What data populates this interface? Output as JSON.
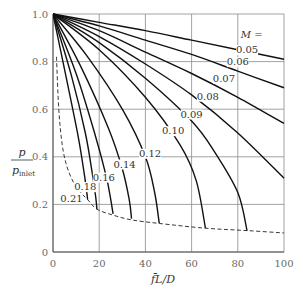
{
  "chart_data": {
    "type": "line",
    "title": "",
    "xlabel": "f̄L/D",
    "ylabel_num": "p",
    "ylabel_den": "p",
    "ylabel_den_sub": "inlet",
    "xlim": [
      0,
      100
    ],
    "ylim": [
      0,
      1.0
    ],
    "x_ticks": [
      "0",
      "20",
      "40",
      "60",
      "80",
      "100"
    ],
    "x_tick_values": [
      0,
      20,
      40,
      60,
      80,
      100
    ],
    "y_ticks": [
      "0",
      "0.2",
      "0.4",
      "0.6",
      "0.8",
      "1.0"
    ],
    "y_tick_values": [
      0,
      0.2,
      0.4,
      0.6,
      0.8,
      1.0
    ],
    "grid": true,
    "legend_header": "M =",
    "series": [
      {
        "name": "0.05",
        "label": "0.05",
        "x": [
          0,
          20,
          40,
          60,
          80,
          100
        ],
        "y": [
          1.0,
          0.965,
          0.93,
          0.89,
          0.85,
          0.81
        ]
      },
      {
        "name": "0.06",
        "label": "0.06",
        "x": [
          0,
          20,
          40,
          60,
          80,
          100
        ],
        "y": [
          1.0,
          0.95,
          0.89,
          0.83,
          0.76,
          0.69
        ]
      },
      {
        "name": "0.07",
        "label": "0.07",
        "x": [
          0,
          20,
          40,
          60,
          80,
          100
        ],
        "y": [
          1.0,
          0.93,
          0.84,
          0.75,
          0.65,
          0.54
        ]
      },
      {
        "name": "0.08",
        "label": "0.08",
        "x": [
          0,
          20,
          40,
          60,
          80,
          100
        ],
        "y": [
          1.0,
          0.905,
          0.79,
          0.66,
          0.5,
          0.31
        ]
      },
      {
        "name": "0.09",
        "label": "0.09",
        "x": [
          0,
          20,
          40,
          60,
          70,
          80,
          84
        ],
        "y": [
          1.0,
          0.88,
          0.73,
          0.55,
          0.42,
          0.25,
          0.09
        ]
      },
      {
        "name": "0.10",
        "label": "0.10",
        "x": [
          0,
          20,
          40,
          55,
          62,
          66
        ],
        "y": [
          1.0,
          0.85,
          0.65,
          0.45,
          0.3,
          0.1
        ]
      },
      {
        "name": "0.12",
        "label": "0.12",
        "x": [
          0,
          15,
          30,
          40,
          44,
          46
        ],
        "y": [
          1.0,
          0.82,
          0.6,
          0.4,
          0.25,
          0.12
        ]
      },
      {
        "name": "0.14",
        "label": "0.14",
        "x": [
          0,
          12,
          24,
          30,
          33,
          34
        ],
        "y": [
          1.0,
          0.78,
          0.52,
          0.35,
          0.22,
          0.14
        ]
      },
      {
        "name": "0.16",
        "label": "0.16",
        "x": [
          0,
          10,
          18,
          23,
          25,
          26
        ],
        "y": [
          1.0,
          0.75,
          0.5,
          0.32,
          0.22,
          0.16
        ]
      },
      {
        "name": "0.18",
        "label": "0.18",
        "x": [
          0,
          8,
          14,
          17,
          18.5,
          19
        ],
        "y": [
          1.0,
          0.74,
          0.5,
          0.33,
          0.23,
          0.18
        ]
      },
      {
        "name": "0.21",
        "label": "0.21",
        "x": [
          0,
          6,
          11,
          13.5,
          14.5,
          15
        ],
        "y": [
          1.0,
          0.72,
          0.48,
          0.33,
          0.26,
          0.22
        ]
      }
    ],
    "choked_line": {
      "name": "choking limit (dashed)",
      "x": [
        1.5,
        2.5,
        4,
        6,
        9,
        12,
        15,
        19,
        26,
        34,
        46,
        66,
        84,
        100
      ],
      "y": [
        0.82,
        0.6,
        0.45,
        0.36,
        0.29,
        0.25,
        0.22,
        0.18,
        0.155,
        0.135,
        0.12,
        0.1,
        0.09,
        0.08
      ]
    },
    "annotations": [
      {
        "text": "M =",
        "x": 86,
        "y": 0.9
      },
      {
        "text": "0.05",
        "x": 84,
        "y": 0.835
      },
      {
        "text": "0.06",
        "x": 80,
        "y": 0.785
      },
      {
        "text": "0.07",
        "x": 74,
        "y": 0.715
      },
      {
        "text": "0.08",
        "x": 67,
        "y": 0.64
      },
      {
        "text": "0.09",
        "x": 60,
        "y": 0.565
      },
      {
        "text": "0.10",
        "x": 52,
        "y": 0.495
      },
      {
        "text": "0.12",
        "x": 42,
        "y": 0.4
      },
      {
        "text": "0.14",
        "x": 31,
        "y": 0.355
      },
      {
        "text": "0.16",
        "x": 22,
        "y": 0.3
      },
      {
        "text": "0.18",
        "x": 14,
        "y": 0.26
      },
      {
        "text": "0.21",
        "x": 8,
        "y": 0.21
      }
    ]
  }
}
